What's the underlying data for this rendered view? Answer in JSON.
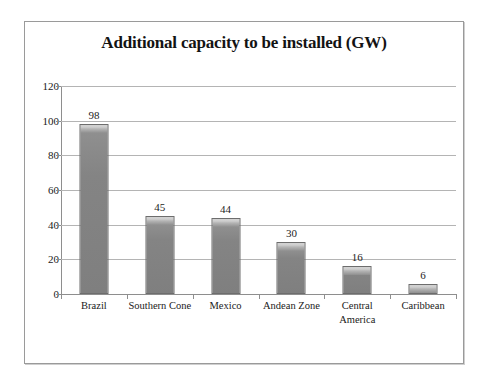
{
  "chart_data": {
    "type": "bar",
    "title": "Additional capacity to be installed (GW)",
    "xlabel": "",
    "ylabel": "",
    "categories": [
      "Brazil",
      "Southern Cone",
      "Mexico",
      "Andean Zone",
      "Central America",
      "Caribbean"
    ],
    "values": [
      98,
      45,
      44,
      30,
      16,
      6
    ],
    "data_labels": [
      "98",
      "45",
      "44",
      "30",
      "16",
      "6"
    ],
    "ylim": [
      0,
      120
    ],
    "yticks": [
      0,
      20,
      40,
      60,
      80,
      100,
      120
    ],
    "ytick_labels": [
      "0",
      "20",
      "40",
      "60",
      "80",
      "100",
      "120"
    ],
    "grid": "horizontal",
    "legend": "none",
    "series": [
      {
        "name": "Additional capacity (GW)",
        "values": [
          98,
          45,
          44,
          30,
          16,
          6
        ]
      }
    ]
  },
  "style": {
    "bar_fill": "#858585",
    "bar_edge": "#6d6d6d",
    "bar_highlight": "#d2d2d2",
    "gridline_color": "#b4b4b4",
    "axis_color": "#8e8e8e",
    "frame_color": "#9a9a9a",
    "text_color": "#1a1a1a",
    "background": "#ffffff"
  }
}
